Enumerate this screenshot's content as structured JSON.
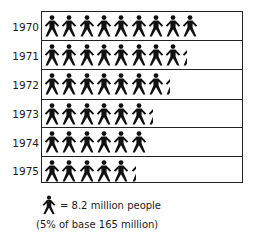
{
  "chart_data": {
    "type": "pictograph",
    "title": "",
    "unit": "8.2 million people per figure",
    "categories": [
      "1970",
      "1971",
      "1972",
      "1973",
      "1974",
      "1975"
    ],
    "figures": [
      9,
      8.3,
      7.3,
      6.3,
      6,
      5.3
    ],
    "values_million": [
      73.8,
      68.1,
      59.9,
      51.7,
      49.2,
      43.5
    ],
    "legend": {
      "symbol": "person-icon",
      "text": "= 8.2 million people",
      "note": "(5% of base 165 million)"
    },
    "color": "#111111"
  },
  "rows": [
    {
      "year": "1970",
      "full": 9,
      "partial": 0
    },
    {
      "year": "1971",
      "full": 8,
      "partial": 0.3
    },
    {
      "year": "1972",
      "full": 7,
      "partial": 0.3
    },
    {
      "year": "1973",
      "full": 6,
      "partial": 0.3
    },
    {
      "year": "1974",
      "full": 6,
      "partial": 0
    },
    {
      "year": "1975",
      "full": 5,
      "partial": 0.3
    }
  ],
  "legend": {
    "text": "= 8.2 million people",
    "note": "(5% of base 165 million)"
  }
}
